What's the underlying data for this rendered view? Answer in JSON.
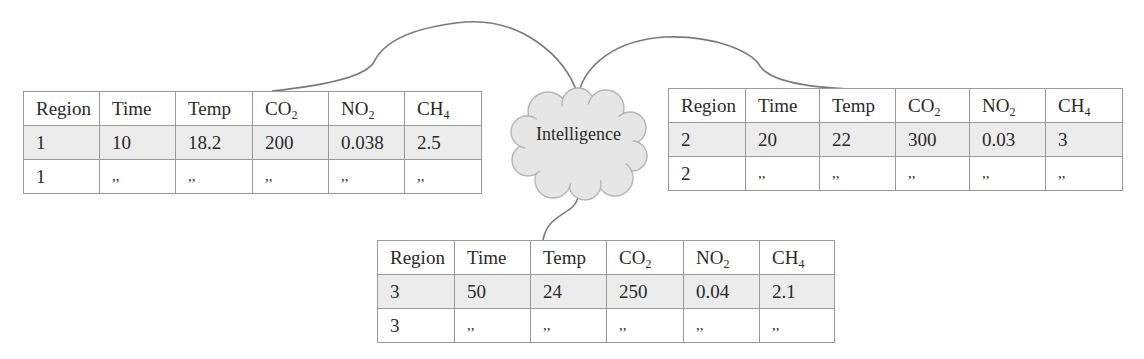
{
  "center_node": {
    "label": "Intelligence",
    "shape": "cloud",
    "fill": "#e6e6e6",
    "stroke": "#b5b5b5"
  },
  "colors": {
    "border": "#9a9a9a",
    "data_row_fill": "#ececec",
    "connector": "#7a7a7a",
    "text": "#2a2a2a"
  },
  "tables": [
    {
      "headers": [
        {
          "base": "Region",
          "sub": ""
        },
        {
          "base": "Time",
          "sub": ""
        },
        {
          "base": "Temp",
          "sub": ""
        },
        {
          "base": "CO",
          "sub": "2"
        },
        {
          "base": "NO",
          "sub": "2"
        },
        {
          "base": "CH",
          "sub": "4"
        }
      ],
      "rows": [
        [
          "1",
          "10",
          "18.2",
          "200",
          "0.038",
          "2.5"
        ],
        [
          "1",
          ",,",
          ",,",
          ",,",
          ",,",
          ",,"
        ]
      ]
    },
    {
      "headers": [
        {
          "base": "Region",
          "sub": ""
        },
        {
          "base": "Time",
          "sub": ""
        },
        {
          "base": "Temp",
          "sub": ""
        },
        {
          "base": "CO",
          "sub": "2"
        },
        {
          "base": "NO",
          "sub": "2"
        },
        {
          "base": "CH",
          "sub": "4"
        }
      ],
      "rows": [
        [
          "2",
          "20",
          "22",
          "300",
          "0.03",
          "3"
        ],
        [
          "2",
          ",,",
          ",,",
          ",,",
          ",,",
          ",,"
        ]
      ]
    },
    {
      "headers": [
        {
          "base": "Region",
          "sub": ""
        },
        {
          "base": "Time",
          "sub": ""
        },
        {
          "base": "Temp",
          "sub": ""
        },
        {
          "base": "CO",
          "sub": "2"
        },
        {
          "base": "NO",
          "sub": "2"
        },
        {
          "base": "CH",
          "sub": "4"
        }
      ],
      "rows": [
        [
          "3",
          "50",
          "24",
          "250",
          "0.04",
          "2.1"
        ],
        [
          "3",
          ",,",
          ",,",
          ",,",
          ",,",
          ",,"
        ]
      ]
    }
  ]
}
